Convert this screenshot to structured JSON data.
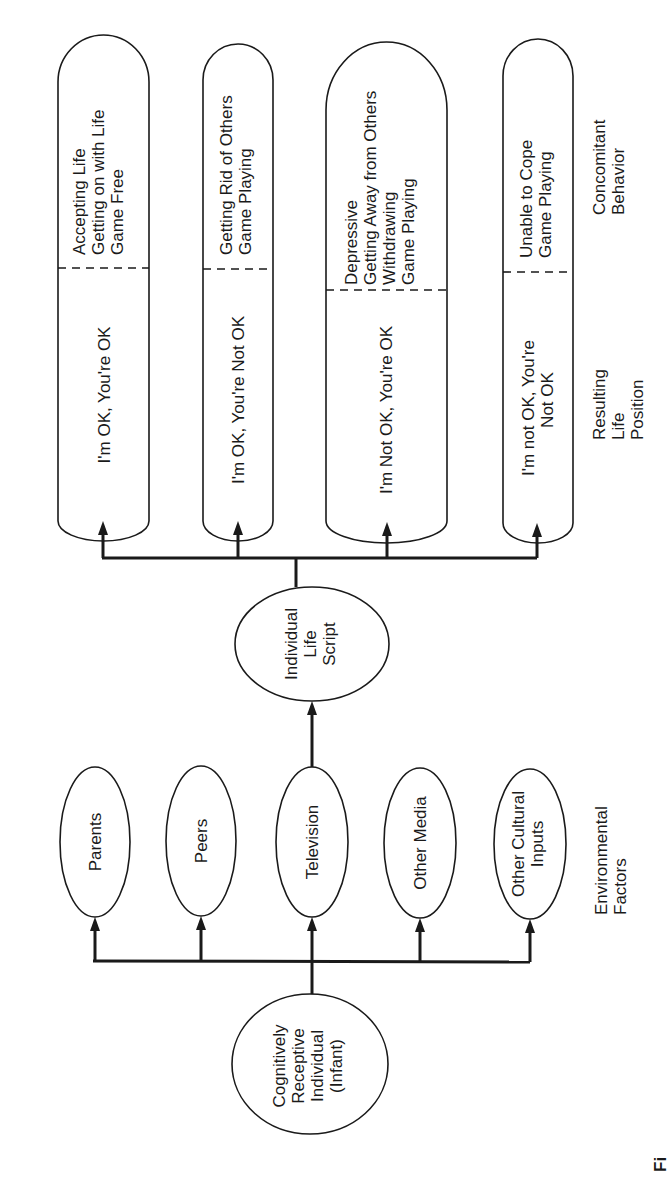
{
  "diagram": {
    "source_node": {
      "lines": [
        "Cognitively",
        "Receptive",
        "Individual",
        "(Infant)"
      ]
    },
    "environmental_factors": {
      "label_lines": [
        "Environmental",
        "Factors"
      ],
      "items": [
        {
          "lines": [
            "Parents"
          ]
        },
        {
          "lines": [
            "Peers"
          ]
        },
        {
          "lines": [
            "Television"
          ]
        },
        {
          "lines": [
            "Other Media"
          ]
        },
        {
          "lines": [
            "Other Cultural",
            "Inputs"
          ]
        }
      ]
    },
    "life_script": {
      "lines": [
        "Individual",
        "Life",
        "Script"
      ]
    },
    "outcomes": {
      "position_label_lines": [
        "Resulting",
        "Life",
        "Position"
      ],
      "behavior_label_lines": [
        "Concomitant",
        "Behavior"
      ],
      "items": [
        {
          "position": [
            "I'm OK, You're OK"
          ],
          "behavior": [
            "Accepting Life",
            "Getting on with Life",
            "Game Free"
          ]
        },
        {
          "position": [
            "I'm OK, You're Not OK"
          ],
          "behavior": [
            "Getting Rid of Others",
            "Game Playing"
          ]
        },
        {
          "position": [
            "I'm Not OK, You're OK"
          ],
          "behavior": [
            "Depressive",
            "Getting Away from Others",
            "Withdrawing",
            "Game Playing"
          ]
        },
        {
          "position": [
            "I'm not OK, You're",
            "Not OK"
          ],
          "behavior": [
            "Unable to Cope",
            "Game Playing"
          ]
        }
      ]
    },
    "caption_fragment": "Fi"
  }
}
